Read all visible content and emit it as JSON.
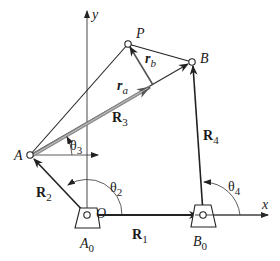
{
  "diagram": {
    "type": "four-bar linkage vector loop",
    "colors": {
      "line": "#222222",
      "r3_fill": "#9a9a9a",
      "background": "#ffffff"
    },
    "axes": {
      "x_label": "x",
      "y_label": "y"
    },
    "points": {
      "origin": "O",
      "A": "A",
      "P": "P",
      "B": "B",
      "A0": "A",
      "A0_sub": "0",
      "B0": "B",
      "B0_sub": "0"
    },
    "vectors": {
      "R1": {
        "main": "R",
        "sub": "1"
      },
      "R2": {
        "main": "R",
        "sub": "2"
      },
      "R3": {
        "main": "R",
        "sub": "3"
      },
      "R4": {
        "main": "R",
        "sub": "4"
      },
      "ra": {
        "main": "r",
        "sub": "a"
      },
      "rb": {
        "main": "r",
        "sub": "b"
      }
    },
    "angles": {
      "theta2": {
        "main": "θ",
        "sub": "2"
      },
      "theta3": {
        "main": "θ",
        "sub": "3"
      },
      "theta4": {
        "main": "θ",
        "sub": "4"
      }
    }
  }
}
